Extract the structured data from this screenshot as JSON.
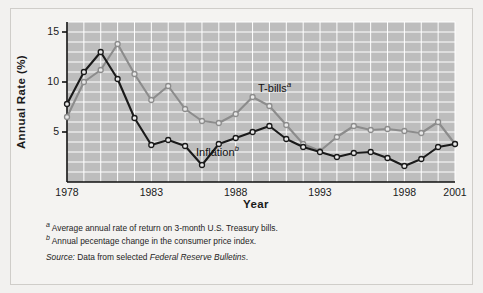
{
  "chart_data": {
    "type": "line",
    "title": "",
    "xlabel": "Year",
    "ylabel": "Annual Rate (%)",
    "xlim": [
      1978,
      2001
    ],
    "ylim": [
      0,
      16
    ],
    "xticks": [
      1978,
      1983,
      1988,
      1993,
      1998,
      2001
    ],
    "yticks": [
      5,
      10,
      15
    ],
    "grid": true,
    "grid_color": "#ffffff",
    "plot_bg": "#bdbdbd",
    "legend_position": "inline-annotation",
    "x": [
      1978,
      1979,
      1980,
      1981,
      1982,
      1983,
      1984,
      1985,
      1986,
      1987,
      1988,
      1989,
      1990,
      1991,
      1992,
      1993,
      1994,
      1995,
      1996,
      1997,
      1998,
      1999,
      2000,
      2001
    ],
    "series": [
      {
        "name": "T-bills",
        "footnote_marker": "a",
        "color": "#8c8c8c",
        "marker": "open-circle",
        "values": [
          6.5,
          10.0,
          11.2,
          13.8,
          10.8,
          8.2,
          9.6,
          7.3,
          6.1,
          5.9,
          6.8,
          8.5,
          7.6,
          5.7,
          3.8,
          3.1,
          4.5,
          5.6,
          5.2,
          5.3,
          5.1,
          4.9,
          6.0,
          3.8
        ]
      },
      {
        "name": "Inflation",
        "footnote_marker": "b",
        "color": "#1a1a1a",
        "marker": "open-circle",
        "values": [
          7.8,
          11.0,
          13.0,
          10.3,
          6.4,
          3.7,
          4.2,
          3.6,
          1.7,
          3.8,
          4.4,
          5.0,
          5.6,
          4.3,
          3.5,
          3.0,
          2.5,
          2.9,
          3.0,
          2.4,
          1.6,
          2.3,
          3.5,
          3.8
        ]
      }
    ],
    "annotations": [
      {
        "text": "T-bills",
        "marker": "a",
        "x": 1991,
        "y": 9.5
      },
      {
        "text": "Inflation",
        "marker": "b",
        "x": 1987.5,
        "y": 2.9
      }
    ]
  },
  "labels": {
    "y_axis_title": "Annual Rate (%)",
    "x_axis_title": "Year",
    "series_tbills": "T-bills",
    "series_tbills_sup": "a",
    "series_inflation": "Inflation",
    "series_inflation_sup": "b"
  },
  "notes": [
    {
      "marker": "a",
      "text": "Average annual rate of return on 3-month U.S. Treasury bills."
    },
    {
      "marker": "b",
      "text": "Annual pecentage change in the consumer price index."
    }
  ],
  "source": {
    "label": "Source:",
    "text_before": " Data from selected ",
    "italic_part": "Federal Reserve Bulletins",
    "text_after": "."
  }
}
